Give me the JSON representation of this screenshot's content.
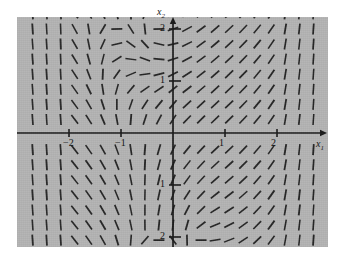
{
  "figure": {
    "kind": "direction-field",
    "background_color": "#b4b4b4",
    "page_color": "#ffffff",
    "stroke_color": "#1a1a1a"
  },
  "axes": {
    "x_label": "x",
    "x_label_sub": "1",
    "y_label": "x",
    "y_label_sub": "2",
    "x_ticks": [
      {
        "value": -2,
        "label": "−2"
      },
      {
        "value": -1,
        "label": "−1"
      },
      {
        "value": 1,
        "label": "1"
      },
      {
        "value": 2,
        "label": "2"
      }
    ],
    "y_ticks": [
      {
        "value": 2,
        "label": "2"
      },
      {
        "value": 1,
        "label": "1"
      },
      {
        "value": -1,
        "label": "1"
      },
      {
        "value": -2,
        "label": "2"
      }
    ],
    "xlim": [
      -3.0,
      2.95
    ],
    "ylim": [
      -2.6,
      2.6
    ],
    "origin_px": {
      "x": 156,
      "y": 116
    },
    "unit_px": 52
  },
  "chart_data": {
    "type": "scatter",
    "title": "",
    "xlabel": "x1",
    "ylabel": "x2",
    "xlim": [
      -3.0,
      2.95
    ],
    "ylim": [
      -2.6,
      2.6
    ],
    "grid": false,
    "legend": "none",
    "sample_grid": {
      "nx": 21,
      "ny": 17,
      "x_start": -2.7,
      "x_step": 0.27,
      "y_start": -2.35,
      "y_step": 0.29
    },
    "tick_length_px": 11,
    "annotations": []
  }
}
